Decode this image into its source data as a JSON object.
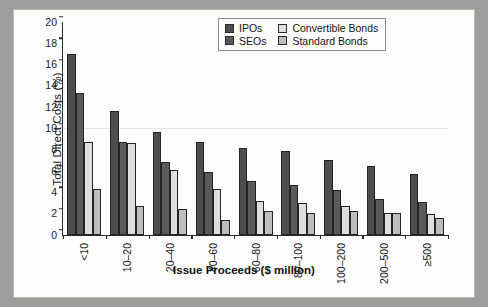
{
  "chart_data": {
    "type": "bar",
    "title": "",
    "xlabel": "Issue Proceeds ($ million)",
    "ylabel": "Total Direct Costs (%)",
    "ylim": [
      0,
      20
    ],
    "yticks": [
      0,
      2,
      4,
      6,
      8,
      10,
      12,
      14,
      16,
      18,
      20
    ],
    "grid": true,
    "legend_position": "top-right",
    "categories": [
      "<10",
      "10–20",
      "20–40",
      "40–60",
      "60–80",
      "80–100",
      "100–200",
      "200–500",
      "≥500"
    ],
    "series": [
      {
        "name": "IPOs",
        "color": "#4d4d4d",
        "values": [
          17.0,
          11.6,
          9.7,
          8.7,
          8.2,
          7.9,
          7.0,
          6.5,
          5.7
        ]
      },
      {
        "name": "SEOs",
        "color": "#5a5a5a",
        "values": [
          13.3,
          8.7,
          6.9,
          5.9,
          5.1,
          4.7,
          4.2,
          3.4,
          3.1
        ]
      },
      {
        "name": "Convertible Bonds",
        "color": "#dedede",
        "values": [
          8.7,
          8.6,
          6.1,
          4.3,
          3.2,
          3.0,
          2.7,
          2.1,
          2.0
        ]
      },
      {
        "name": "Standard Bonds",
        "color": "#bdbdbd",
        "values": [
          4.3,
          2.7,
          2.4,
          1.4,
          2.3,
          2.1,
          2.3,
          2.1,
          1.6
        ]
      }
    ]
  },
  "legend": {
    "items": [
      {
        "label": "IPOs"
      },
      {
        "label": "Convertible Bonds"
      },
      {
        "label": "SEOs"
      },
      {
        "label": "Standard Bonds"
      }
    ]
  }
}
